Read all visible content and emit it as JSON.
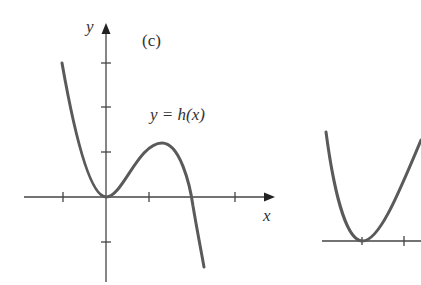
{
  "figure": {
    "panel_label": "(c)",
    "function_label": "y = h(x)",
    "y_axis_label": "y",
    "x_axis_label": "x",
    "curve_color": "#5a5a5a",
    "axis_color": "#444444"
  },
  "main_graph": {
    "description": "Cubic-like curve touching origin, local max at positive x, then descending",
    "x_ticks": [
      -1,
      1,
      2
    ],
    "y_ticks": [
      -1,
      1,
      2,
      3
    ],
    "key_points": {
      "local_min": [
        0,
        0
      ],
      "local_max": [
        1.3,
        1.2
      ],
      "x_intercept": [
        2.0,
        0
      ]
    }
  },
  "partial_graph": {
    "description": "Partially visible parabola-like curve touching axis at its minimum"
  }
}
